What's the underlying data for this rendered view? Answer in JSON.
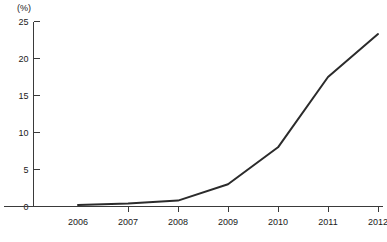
{
  "chart_data": {
    "type": "line",
    "title": "",
    "subtitle": "",
    "xlabel": "",
    "ylabel": "",
    "unit_label": "(%)",
    "categories": [
      "2006",
      "2007",
      "2008",
      "2009",
      "2010",
      "2011",
      "2012"
    ],
    "x": [
      2006,
      2007,
      2008,
      2009,
      2010,
      2011,
      2012
    ],
    "values": [
      0.2,
      0.4,
      0.8,
      3.0,
      8.0,
      17.5,
      23.3
    ],
    "series": [
      {
        "name": "",
        "values": [
          0.2,
          0.4,
          0.8,
          3.0,
          8.0,
          17.5,
          23.3
        ]
      }
    ],
    "ylim": [
      0,
      25
    ],
    "yticks": [
      0,
      5,
      10,
      15,
      20,
      25
    ],
    "ytick_labels": [
      "0",
      "5",
      "10",
      "15",
      "20",
      "25"
    ],
    "xtick_labels": [
      "2006",
      "2007",
      "2008",
      "2009",
      "2010",
      "2011",
      "2012"
    ],
    "xlim": [
      2006,
      2012
    ],
    "grid": false,
    "legend": false,
    "legend_position": "none",
    "annotations": [],
    "line_color": "#2b2b2b",
    "background_color": "#ffffff",
    "axis_color": "#3a3a3a"
  }
}
